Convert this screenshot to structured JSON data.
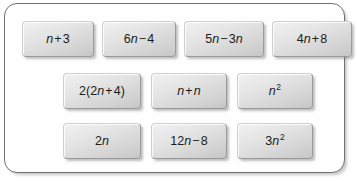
{
  "panel": {
    "border_color": "#6f6f6f",
    "background_color": "#fefefe"
  },
  "tile_style": {
    "fill_light": "#f1f1f1",
    "fill_dark": "#c6c6c6",
    "border_color": "#9a9a9a",
    "text_color": "#1c1c1c"
  },
  "rows": [
    {
      "name": "row-1",
      "tiles": [
        {
          "text": "n + 3",
          "base": "n",
          "op": "+",
          "operand": "3",
          "coefficient": "",
          "exponent": ""
        },
        {
          "text": "6n − 4",
          "base": "n",
          "op": "−",
          "operand": "4",
          "coefficient": "6",
          "exponent": ""
        },
        {
          "text": "5n − 3n",
          "base": "n",
          "op": "−",
          "operand": "3n",
          "coefficient": "5",
          "exponent": ""
        },
        {
          "text": "4n + 8",
          "base": "n",
          "op": "+",
          "operand": "8",
          "coefficient": "4",
          "exponent": ""
        }
      ]
    },
    {
      "name": "row-2",
      "tiles": [
        {
          "text": "2(2n + 4)",
          "base": "n",
          "op": "+",
          "operand": "4",
          "coefficient": "2",
          "exponent": ""
        },
        {
          "text": "n + n",
          "base": "n",
          "op": "+",
          "operand": "n",
          "coefficient": "",
          "exponent": ""
        },
        {
          "text": "n²",
          "base": "n",
          "op": "",
          "operand": "",
          "coefficient": "",
          "exponent": "2"
        }
      ]
    },
    {
      "name": "row-3",
      "tiles": [
        {
          "text": "2n",
          "base": "n",
          "op": "",
          "operand": "",
          "coefficient": "2",
          "exponent": ""
        },
        {
          "text": "12n − 8",
          "base": "n",
          "op": "−",
          "operand": "8",
          "coefficient": "12",
          "exponent": ""
        },
        {
          "text": "3n²",
          "base": "n",
          "op": "",
          "operand": "",
          "coefficient": "3",
          "exponent": "2"
        }
      ]
    }
  ],
  "tiles_flat": {
    "t1": "n + 3",
    "t2": "6n − 4",
    "t3": "5n − 3n",
    "t4": "4n + 8",
    "t5": "2(2n + 4)",
    "t6": "n + n",
    "t7": "n²",
    "t8": "2n",
    "t9": "12n − 8",
    "t10": "3n²"
  },
  "parts": {
    "p_n_plus_3": {
      "c": "",
      "v": "n",
      "op": "+",
      "rest": "3",
      "sup": ""
    },
    "p_6n_minus_4": {
      "c": "6",
      "v": "n",
      "op": "−",
      "rest": "4",
      "sup": ""
    },
    "p_5n_minus_3n": {
      "c": "5",
      "v": "n",
      "op": "−",
      "rest": "3",
      "sup": "",
      "rest_v": "n"
    },
    "p_4n_plus_8": {
      "c": "4",
      "v": "n",
      "op": "+",
      "rest": "8",
      "sup": ""
    },
    "p_2_2n_plus_4": {
      "c": "2(2",
      "v": "n",
      "op": "+",
      "rest": "4)",
      "sup": ""
    },
    "p_n_plus_n": {
      "c": "",
      "v": "n",
      "op": "+",
      "rest": "",
      "sup": "",
      "rest_v": "n"
    },
    "p_n_sq": {
      "c": "",
      "v": "n",
      "op": "",
      "rest": "",
      "sup": "2"
    },
    "p_2n": {
      "c": "2",
      "v": "n",
      "op": "",
      "rest": "",
      "sup": ""
    },
    "p_12n_minus_8": {
      "c": "12",
      "v": "n",
      "op": "−",
      "rest": "8",
      "sup": ""
    },
    "p_3n_sq": {
      "c": "3",
      "v": "n",
      "op": "",
      "rest": "",
      "sup": "2"
    }
  }
}
